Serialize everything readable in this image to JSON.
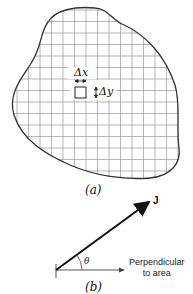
{
  "figure_a": {
    "delta_x_label": "Δx",
    "delta_y_label": "Δy",
    "caption": "(a)",
    "grid_spacing_px": 11.5,
    "outline_color": "#333333",
    "grid_color": "#9a9a9a"
  },
  "figure_b": {
    "vector_label": "J",
    "angle_label": "θ",
    "perpendicular_label_line1": "Perpendicular",
    "perpendicular_label_line2": "to area",
    "caption": "(b)"
  }
}
